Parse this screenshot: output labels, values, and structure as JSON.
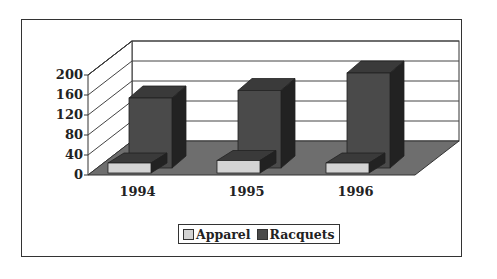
{
  "chart_data": {
    "type": "bar",
    "subtype": "3d-column-clustered",
    "title": "",
    "xlabel": "",
    "ylabel": "",
    "categories": [
      "1994",
      "1995",
      "1996"
    ],
    "series": [
      {
        "name": "Apparel",
        "values": [
          20,
          25,
          20
        ],
        "color": "#d4d4d4"
      },
      {
        "name": "Racquets",
        "values": [
          140,
          155,
          190
        ],
        "color": "#4a4a4a"
      }
    ],
    "y_ticks": [
      "0",
      "40",
      "80",
      "120",
      "160",
      "200"
    ],
    "ylim": [
      0,
      200
    ],
    "grid": true,
    "legend_position": "bottom"
  },
  "legend": {
    "items": [
      {
        "label": "Apparel",
        "color": "#d4d4d4"
      },
      {
        "label": "Racquets",
        "color": "#4a4a4a"
      }
    ]
  },
  "colors": {
    "floor": "#6e6e6e",
    "bar_dark_front": "#4a4a4a",
    "bar_dark_top": "#3a3a3a",
    "bar_dark_side": "#222222",
    "bar_light_front": "#d4d4d4",
    "frame": "#333333"
  }
}
